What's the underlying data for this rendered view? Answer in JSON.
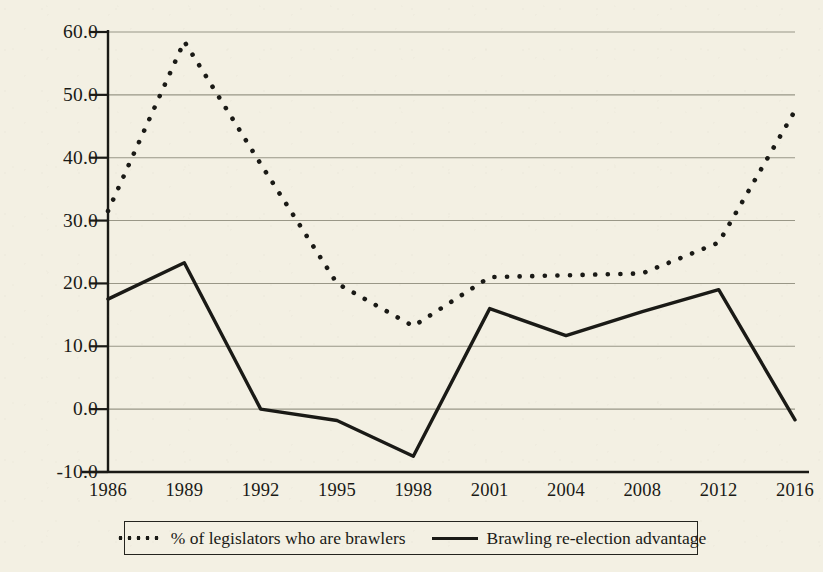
{
  "chart_data": {
    "type": "line",
    "title": "",
    "subtitle": "",
    "xlabel": "",
    "ylabel": "",
    "x": [
      1986,
      1989,
      1992,
      1995,
      1998,
      2001,
      2004,
      2008,
      2012,
      2016
    ],
    "categories": [
      "1986",
      "1989",
      "1992",
      "1995",
      "1998",
      "2001",
      "2004",
      "2008",
      "2012",
      "2016"
    ],
    "xlim": [
      1986,
      2016
    ],
    "ylim": [
      -10.0,
      60.0
    ],
    "yticks": [
      -10.0,
      0.0,
      10.0,
      20.0,
      30.0,
      40.0,
      50.0,
      60.0
    ],
    "ytick_labels": [
      "-10.0",
      "0.0",
      "10.0",
      "20.0",
      "30.0",
      "40.0",
      "50.0",
      "60.0"
    ],
    "grid": true,
    "grid_axis": "y",
    "legend_position": "below",
    "series": [
      {
        "name": "% of legislators who are brawlers",
        "style": "dotted",
        "values": [
          31.5,
          58.5,
          39.0,
          20.0,
          13.2,
          21.0,
          21.3,
          21.6,
          26.5,
          47.5
        ]
      },
      {
        "name": "Brawling re-election advantage",
        "style": "solid",
        "values": [
          17.5,
          23.3,
          0.0,
          -1.8,
          -7.5,
          16.0,
          11.7,
          15.5,
          19.0,
          -1.7
        ]
      }
    ]
  },
  "legend": {
    "entries": [
      {
        "label": "% of legislators who are brawlers",
        "style": "dotted"
      },
      {
        "label": "Brawling re-election advantage",
        "style": "solid"
      }
    ]
  },
  "colors": {
    "background": "#f3f0e3",
    "ink": "#1a1a16",
    "gridline": "#8a8878"
  }
}
